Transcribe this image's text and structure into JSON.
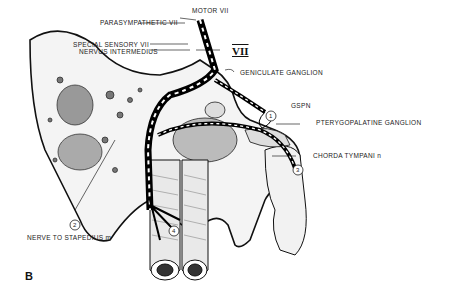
{
  "figure": {
    "panel_label": "B"
  },
  "labels": {
    "parasympathetic": "PARASYMPATHETIC VII",
    "motor": "MOTOR VII",
    "special_sensory": "SPECIAL SENSORY VII",
    "nervus_intermedius": "NERVUS INTERMEDIUS",
    "vii": "VII",
    "geniculate": "GENICULATE GANGLION",
    "gspn": "GSPN",
    "pterygopalatine": "PTERYGOPALATINE GANGLION",
    "chorda": "CHORDA TYMPANI n",
    "stapedius": "NERVE TO STAPEDIUS m"
  },
  "markers": [
    "1",
    "2",
    "3",
    "4"
  ]
}
